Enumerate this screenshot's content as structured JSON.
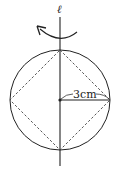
{
  "diagram": {
    "axis_label": "ℓ",
    "radius_label": "3cm",
    "colors": {
      "stroke": "#222222",
      "background": "#ffffff"
    },
    "shapes": {
      "circle": {
        "cx": 60,
        "cy": 100,
        "r": 50
      },
      "inscribed_square": "dashed diamond with vertices on circle",
      "axis": "vertical rotation axis through circle center",
      "rotation_arrow": "curved arrow indicating rotation about axis"
    }
  }
}
